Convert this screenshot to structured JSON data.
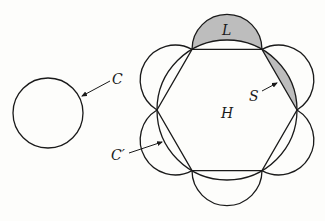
{
  "figure": {
    "labels": {
      "C": "C",
      "C_prime": "C′",
      "L": "L",
      "S": "S",
      "H": "H"
    },
    "colors": {
      "stroke": "#1a1a1a",
      "shade": "#bdbdbd",
      "background": "#fdfdfb"
    },
    "shapes": {
      "small_circle": {
        "cx": 48,
        "cy": 113,
        "r": 35
      },
      "hexagon": {
        "cx": 227,
        "cy": 110,
        "R": 70
      },
      "semicircle_radius": 35
    }
  }
}
